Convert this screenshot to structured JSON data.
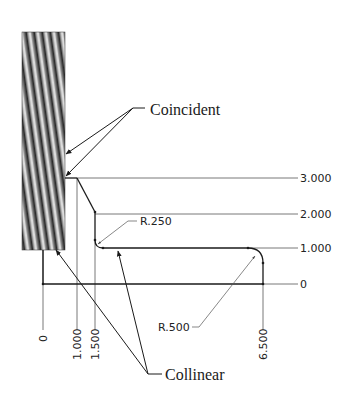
{
  "annotations": {
    "coincident": "Coincident",
    "collinear": "Collinear"
  },
  "horizontal_dims": {
    "d3": "3.000",
    "d2": "2.000",
    "d1": "1.000",
    "d0": "0"
  },
  "vertical_dims": {
    "v0": "0",
    "v1": "1.000",
    "v15": "1.500",
    "v65": "6.500"
  },
  "radii": {
    "small": "R.250",
    "large": "R.500"
  },
  "colors": {
    "line": "#1a1a1a",
    "dim_line": "#555555",
    "rod_dark": "#3a3a3a",
    "rod_light": "#c8c8c8"
  }
}
